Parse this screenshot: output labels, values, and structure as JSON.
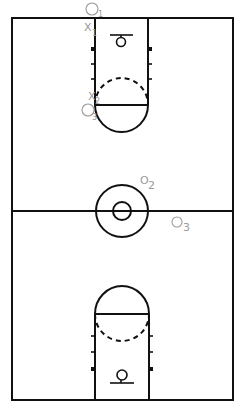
{
  "diagram": {
    "line_color": "#111111",
    "player_color": "#9a9a9a",
    "players": [
      {
        "id": "o1",
        "symbol": "O",
        "sub": "1",
        "team": "offense",
        "x": 92,
        "y": 9
      },
      {
        "id": "x1",
        "symbol": "X",
        "sub": "1",
        "team": "defense",
        "x": 88,
        "y": 27
      },
      {
        "id": "x2",
        "symbol": "X",
        "sub": "2",
        "team": "defense",
        "x": 92,
        "y": 96
      },
      {
        "id": "o2",
        "symbol": "O",
        "sub": "2",
        "team": "offense",
        "x": 86,
        "y": 108
      },
      {
        "id": "x3",
        "symbol": "X",
        "sub": "3",
        "team": "defense",
        "x": 143,
        "y": 180
      },
      {
        "id": "o3",
        "symbol": "O",
        "sub": "3",
        "team": "offense",
        "x": 176,
        "y": 222
      }
    ]
  }
}
